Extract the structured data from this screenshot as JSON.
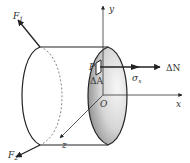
{
  "figure": {
    "colors": {
      "stroke": "#222222",
      "dashed": "#777777",
      "shade_dark": "#9a9a9a",
      "shade_light": "#f2f2f2",
      "background": "#ffffff"
    }
  },
  "labels": {
    "F1": "F",
    "F1_sub": "1",
    "F2": "F",
    "F2_sub": "2",
    "y_axis": "y",
    "x_axis": "x",
    "z_axis": "z",
    "origin": "O",
    "point": "P",
    "area": "ΔA",
    "sigma": "σ",
    "sigma_sub": "x",
    "delta_N": "ΔN"
  }
}
